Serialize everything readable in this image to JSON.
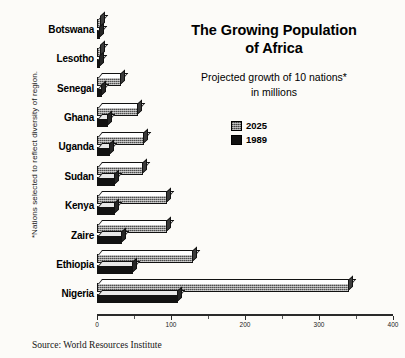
{
  "title": "The Growing Population\nof Africa",
  "title_line1": "The Growing Population",
  "title_line2": "of Africa",
  "subtitle_line1": "Projected growth of 10 nations*",
  "subtitle_line2": "in millions",
  "side_note": "*Nations selected to reflect diversity of region.",
  "source": "Source: World Resources Institute",
  "legend": [
    {
      "label": "2025",
      "color": "#8a8a8a",
      "swatch": "sw-2025"
    },
    {
      "label": "1989",
      "color": "#121212",
      "swatch": "sw-1989"
    }
  ],
  "axis": {
    "ticks": [
      "0",
      "100",
      "200",
      "300",
      "400"
    ],
    "minor_ticks": [
      "50",
      "150",
      "250",
      "350"
    ]
  },
  "chart_data": {
    "type": "bar",
    "orientation": "horizontal",
    "title": "The Growing Population of Africa",
    "subtitle": "Projected growth of 10 nations* in millions",
    "xlabel": "",
    "ylabel": "",
    "xlim": [
      0,
      400
    ],
    "grid": false,
    "legend_position": "upper-right",
    "categories": [
      "Botswana",
      "Lesotho",
      "Senegal",
      "Ghana",
      "Uganda",
      "Sudan",
      "Kenya",
      "Zaire",
      "Ethiopia",
      "Nigeria"
    ],
    "series": [
      {
        "name": "2025",
        "values": [
          6,
          6,
          32,
          55,
          63,
          62,
          95,
          95,
          130,
          340
        ]
      },
      {
        "name": "1989",
        "values": [
          2,
          2,
          7,
          15,
          18,
          24,
          24,
          34,
          48,
          110
        ]
      }
    ],
    "units": "millions",
    "source": "World Resources Institute"
  }
}
